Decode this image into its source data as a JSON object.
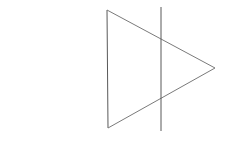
{
  "canvas": {
    "width": 228,
    "height": 145,
    "background_color": "#ffffff",
    "title": "Geometric line drawing: right-pointing triangle crossed by a vertical line"
  },
  "figure": {
    "name": "triangle-with-crossing-vertical-line",
    "stroke_color": "#595959",
    "stroke_color_light": "#8c8c8c",
    "stroke_width": 1,
    "shapes": [
      {
        "id": "triangle",
        "name": "right-pointing-triangle",
        "type": "polygon",
        "closed": true,
        "stroke_color": "#595959",
        "stroke_width": 1,
        "fill": "none",
        "points": [
          {
            "label": "top-left-vertex",
            "x": 107,
            "y": 10
          },
          {
            "label": "right-apex-vertex",
            "x": 215,
            "y": 68
          },
          {
            "label": "bottom-left-vertex",
            "x": 108,
            "y": 128
          }
        ],
        "edges": [
          {
            "id": "left-edge",
            "name": "triangle-left-vertical-edge",
            "x1": 107,
            "y1": 10,
            "x2": 108,
            "y2": 128,
            "stroke_color": "#595959"
          },
          {
            "id": "upper-edge",
            "name": "triangle-upper-diagonal-edge",
            "x1": 107,
            "y1": 10,
            "x2": 215,
            "y2": 68,
            "stroke_color": "#7a7a7a"
          },
          {
            "id": "lower-edge",
            "name": "triangle-lower-diagonal-edge",
            "x1": 108,
            "y1": 128,
            "x2": 215,
            "y2": 68,
            "stroke_color": "#7a7a7a"
          }
        ]
      },
      {
        "id": "vertical-line",
        "name": "crossing-vertical-line",
        "type": "line",
        "stroke_color": "#595959",
        "stroke_width": 1,
        "x1": 161,
        "y1": 7,
        "x2": 161,
        "y2": 131
      }
    ],
    "intersections": [
      {
        "id": "upper-intersection",
        "name": "vertical-line-crosses-upper-edge",
        "x": 161,
        "y": 39
      },
      {
        "id": "lower-intersection",
        "name": "vertical-line-crosses-lower-edge",
        "x": 161,
        "y": 98
      }
    ]
  }
}
